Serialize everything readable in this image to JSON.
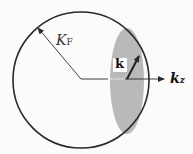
{
  "diagram": {
    "labels": {
      "fermi_radius_main": "K",
      "fermi_radius_sub": "F",
      "vector_k": "k",
      "axis_main": "k",
      "axis_sub": "z"
    },
    "colors": {
      "outline": "#2a2a2a",
      "shaded_region": "#b9b9b9",
      "background": "#fbfbfa"
    }
  }
}
